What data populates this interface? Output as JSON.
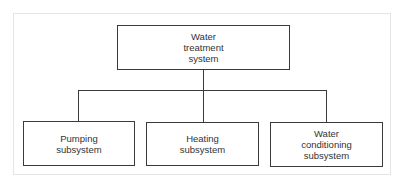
{
  "diagram": {
    "type": "hierarchy",
    "root": {
      "label": "Water\ntreatment\nsystem"
    },
    "children": [
      {
        "label": "Pumping\nsubsystem"
      },
      {
        "label": "Heating\nsubsystem"
      },
      {
        "label": "Water\nconditioning\nsubsystem"
      }
    ]
  },
  "colors": {
    "line": "#3a3a3a",
    "text": "#333333",
    "frame": "#e4e4e4",
    "background": "#ffffff"
  }
}
